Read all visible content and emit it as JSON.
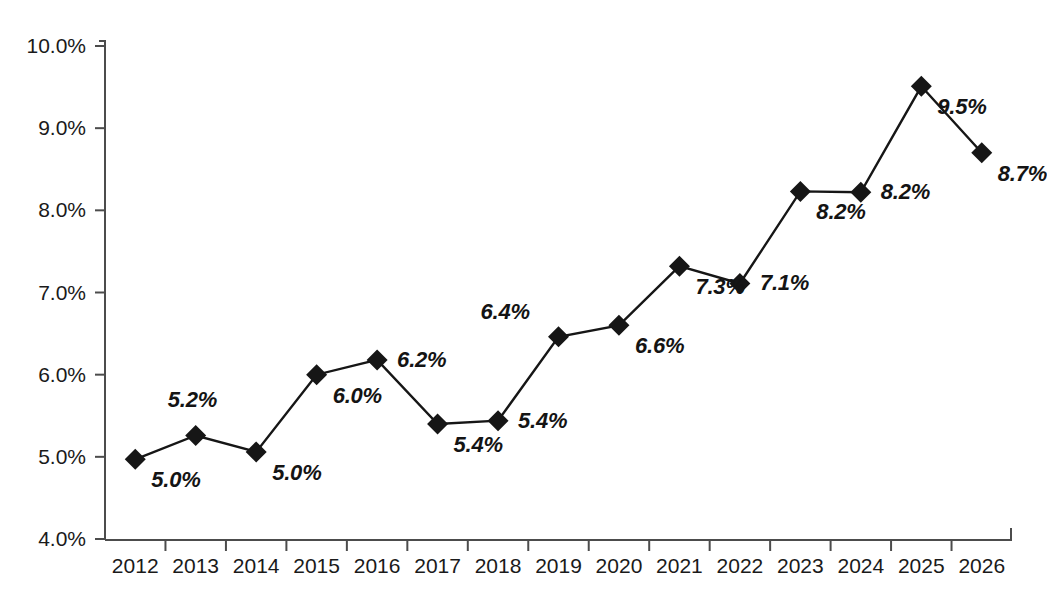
{
  "chart_data": {
    "type": "line",
    "title": "",
    "subtitle": "",
    "xlabel": "",
    "ylabel": "",
    "categories": [
      "2012",
      "2013",
      "2014",
      "2015",
      "2016",
      "2017",
      "2018",
      "2019",
      "2020",
      "2021",
      "2022",
      "2023",
      "2024",
      "2025",
      "2026"
    ],
    "values": [
      5.0,
      5.2,
      5.0,
      6.0,
      6.2,
      5.4,
      5.4,
      6.4,
      6.6,
      7.3,
      7.1,
      8.2,
      8.2,
      9.5,
      8.7
    ],
    "plotted_values": [
      4.97,
      5.26,
      5.06,
      6.0,
      6.18,
      5.4,
      5.44,
      6.46,
      6.6,
      7.32,
      7.11,
      8.23,
      8.22,
      9.51,
      8.7
    ],
    "data_labels": [
      "5.0%",
      "5.2%",
      "5.0%",
      "6.0%",
      "6.2%",
      "5.4%",
      "5.4%",
      "6.4%",
      "6.6%",
      "7.3%",
      "7.1%",
      "8.2%",
      "8.2%",
      "9.5%",
      "8.7%"
    ],
    "label_positions": [
      "below-right",
      "above",
      "below-right",
      "below-right",
      "right",
      "below-right",
      "right",
      "above-left",
      "below-right",
      "below-right",
      "right",
      "below-right",
      "right",
      "below-right",
      "below-right"
    ],
    "yticks": [
      4.0,
      5.0,
      6.0,
      7.0,
      8.0,
      9.0,
      10.0
    ],
    "ytick_labels": [
      "4.0%",
      "5.0%",
      "6.0%",
      "7.0%",
      "8.0%",
      "9.0%",
      "10.0%"
    ],
    "ylim": [
      4.0,
      10.0
    ],
    "grid": false,
    "legend": null,
    "marker": "diamond",
    "series_color": "#161616",
    "axis_color": "#4c4c4c",
    "line_width": 2
  }
}
